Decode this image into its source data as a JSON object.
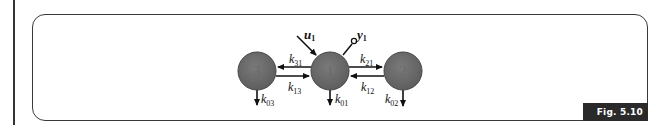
{
  "figure": {
    "label": "Fig. 5.10",
    "accent_color": "#2a2a2a",
    "compartment_fill": "#6b6b6b"
  },
  "compartments": [
    {
      "id": "3",
      "label": "3",
      "cx": 257,
      "cy": 71
    },
    {
      "id": "1",
      "label": "1",
      "cx": 330,
      "cy": 71
    },
    {
      "id": "2",
      "label": "2",
      "cx": 403,
      "cy": 71
    }
  ],
  "rates": {
    "k31": {
      "base": "k",
      "sub": "31"
    },
    "k13": {
      "base": "k",
      "sub": "13"
    },
    "k21": {
      "base": "k",
      "sub": "21"
    },
    "k12": {
      "base": "k",
      "sub": "12"
    },
    "k01": {
      "base": "k",
      "sub": "01"
    },
    "k02": {
      "base": "k",
      "sub": "02"
    },
    "k03": {
      "base": "k",
      "sub": "03"
    }
  },
  "input": {
    "base": "u",
    "sub": "1"
  },
  "output": {
    "base": "y",
    "sub": "1"
  }
}
